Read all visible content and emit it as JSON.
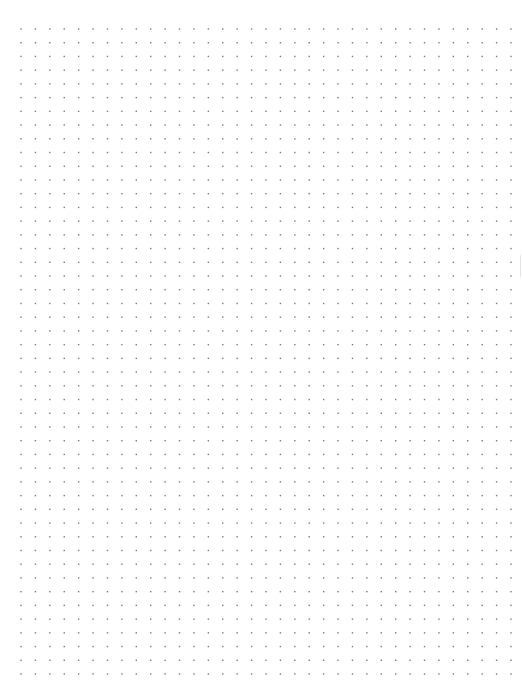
{
  "page": {
    "type": "dot-grid-paper",
    "background_color": "#ffffff",
    "dot_color": "#7a7a7a"
  },
  "grid": {
    "columns": 35,
    "rows": 48
  }
}
